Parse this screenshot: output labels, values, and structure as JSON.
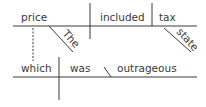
{
  "diagram": {
    "type": "sentence-diagram",
    "colors": {
      "line": "#3a3a3a",
      "text": "#3a3a3a",
      "background": "#ffffff"
    },
    "main_clause": {
      "subject": "price",
      "verb": "included",
      "object": "tax",
      "subject_modifier": "The",
      "object_modifier": "state"
    },
    "relative_clause": {
      "subject": "which",
      "verb": "was",
      "complement": "outrageous"
    }
  }
}
